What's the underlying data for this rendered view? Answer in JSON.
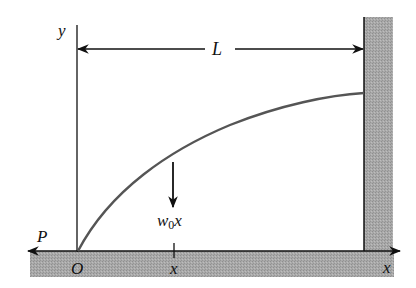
{
  "diagram": {
    "type": "beam-deflection",
    "labels": {
      "y_axis": "y",
      "x_axis": "x",
      "origin": "O",
      "length": "L",
      "force": "P",
      "load_base": "w",
      "load_subscript": "0",
      "load_var": "x",
      "position_tick": "x"
    },
    "colors": {
      "line": "#111111",
      "curve": "#555555",
      "hatch_fill": "#a8a8a8",
      "background": "#ffffff"
    }
  }
}
